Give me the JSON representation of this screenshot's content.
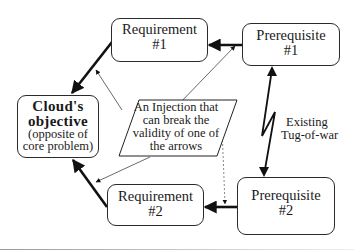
{
  "diagram": {
    "type": "evaporating cloud (conflict resolution diagram)",
    "nodes": {
      "objective": {
        "title": "Cloud's",
        "title2": "objective",
        "subtitle1": "(opposite of",
        "subtitle2": "core problem)"
      },
      "requirement1": {
        "line1": "Requirement",
        "line2": "#1"
      },
      "requirement2": {
        "line1": "Requirement",
        "line2": "#2"
      },
      "prerequisite1": {
        "line1": "Prerequisite",
        "line2": "#1"
      },
      "prerequisite2": {
        "line1": "Prerequisite",
        "line2": "#2"
      }
    },
    "injection": {
      "line1": "An Injection that",
      "line2": "can break the",
      "line3": "validity of one of",
      "line4": "the arrows"
    },
    "conflict_label": {
      "line1": "Existing",
      "line2": "Tug-of-war"
    },
    "edges": [
      {
        "from": "requirement1",
        "to": "objective",
        "style": "thick"
      },
      {
        "from": "requirement2",
        "to": "objective",
        "style": "thick"
      },
      {
        "from": "prerequisite1",
        "to": "requirement1",
        "style": "thick"
      },
      {
        "from": "prerequisite2",
        "to": "requirement2",
        "style": "thick"
      },
      {
        "from": "prerequisite1",
        "to": "prerequisite2",
        "style": "zigzag-double-headed",
        "label": "Existing Tug-of-war"
      },
      {
        "from": "injection",
        "to": "edge requirement1-objective",
        "style": "thin"
      },
      {
        "from": "injection",
        "to": "edge requirement2-objective",
        "style": "thin"
      },
      {
        "from": "injection",
        "to": "edge prerequisite1-requirement1",
        "style": "thin"
      },
      {
        "from": "injection",
        "to": "edge prerequisite2-requirement2",
        "style": "dashed"
      }
    ]
  }
}
